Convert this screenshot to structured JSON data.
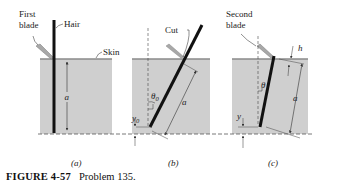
{
  "figure": {
    "caption_label": "FIGURE 4-57",
    "caption_text": "Problem 135.",
    "colors": {
      "skin_fill": "#cfcfcf",
      "skin_line": "#8a8a8a",
      "hair": "#111111",
      "blade": "#a8a8a8",
      "text": "#222222"
    },
    "panels": [
      {
        "id": "a",
        "sublabel": "(a)",
        "labels": {
          "blade": [
            "First",
            "blade"
          ],
          "hair": "Hair",
          "skin": "Skin",
          "length": "a"
        }
      },
      {
        "id": "b",
        "sublabel": "(b)",
        "labels": {
          "cut": "Cut",
          "angle": "θ0",
          "offset": "y0",
          "length": "a"
        }
      },
      {
        "id": "c",
        "sublabel": "(c)",
        "labels": {
          "blade": [
            "Second",
            "blade"
          ],
          "angle": "θ",
          "offset": "y",
          "height": "h",
          "length": "a"
        }
      }
    ]
  }
}
